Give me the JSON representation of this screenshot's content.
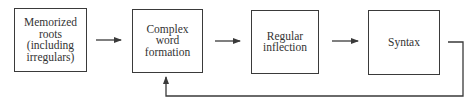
{
  "diagram": {
    "nodes": [
      {
        "id": "memorized-roots",
        "lines": [
          "Memorized",
          "roots",
          "(including",
          "irregulars)"
        ]
      },
      {
        "id": "complex-word-formation",
        "lines": [
          "Complex",
          "word",
          "formation"
        ]
      },
      {
        "id": "regular-inflection",
        "lines": [
          "Regular",
          "inflection"
        ]
      },
      {
        "id": "syntax",
        "lines": [
          "Syntax"
        ]
      }
    ],
    "edges": [
      {
        "from": "memorized-roots",
        "to": "complex-word-formation"
      },
      {
        "from": "complex-word-formation",
        "to": "regular-inflection"
      },
      {
        "from": "regular-inflection",
        "to": "syntax"
      },
      {
        "from": "syntax",
        "to": "complex-word-formation",
        "type": "feedback"
      }
    ],
    "colors": {
      "stroke": "#3a3a3a",
      "text": "#333333",
      "background": "#ffffff"
    }
  }
}
